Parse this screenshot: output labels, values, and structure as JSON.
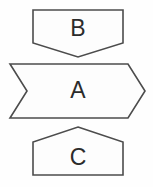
{
  "canvas": {
    "width": 153,
    "height": 187,
    "background_color": "#fefefe"
  },
  "style": {
    "stroke_color": "#4c4c4c",
    "fill_color": "#fdfdfd",
    "label_color": "#2b2b2b",
    "stroke_width": 1.6
  },
  "diagram": {
    "title": "",
    "shapes": [
      {
        "id": "shape-b",
        "label": "B",
        "kind": "pentagon-down",
        "points": "33,10 123,10 123,43 78,57 33,43",
        "label_x": 78,
        "label_y": 30
      },
      {
        "id": "shape-a",
        "label": "A",
        "kind": "chevron-right",
        "points": "10,64 128,64 145,91 128,118 10,118 27,91",
        "label_x": 78,
        "label_y": 92
      },
      {
        "id": "shape-c",
        "label": "C",
        "kind": "pentagon-up",
        "points": "78,127 123,142 123,175 33,175 33,142",
        "label_x": 78,
        "label_y": 159
      }
    ]
  }
}
